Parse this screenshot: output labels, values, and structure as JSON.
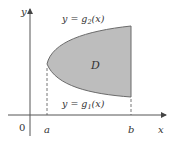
{
  "diagram": {
    "axes": {
      "x_label": "x",
      "y_label": "y",
      "origin_label": "0"
    },
    "ticks": {
      "a_label": "a",
      "b_label": "b"
    },
    "curves": {
      "upper_label_prefix": "y = g",
      "upper_subscript": "2",
      "upper_suffix": "(x)",
      "lower_label_prefix": "y = g",
      "lower_subscript": "1",
      "lower_suffix": "(x)"
    },
    "region_label": "D",
    "colors": {
      "region_fill": "#bdbdbd",
      "region_stroke": "#6b6b6b",
      "axis": "#555555",
      "text": "#333333"
    }
  }
}
